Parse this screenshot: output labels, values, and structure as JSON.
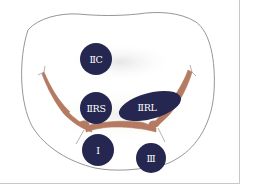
{
  "diagram": {
    "type": "anatomical-zone-diagram",
    "colors": {
      "zone_fill": "#252750",
      "zone_text": "#ffffff",
      "nerve": "#b47a62",
      "outline": "#8a8a8a",
      "shading": "#ececec",
      "frame": "#c8c8c8"
    },
    "zones": [
      {
        "id": "IIC",
        "label": "ⅡC",
        "shape": "circle",
        "cx": 96,
        "cy": 59,
        "r": 16
      },
      {
        "id": "IIRS",
        "label": "ⅡRS",
        "shape": "circle",
        "cx": 96,
        "cy": 108,
        "r": 16
      },
      {
        "id": "IIRL",
        "label": "ⅡRL",
        "shape": "ellipse",
        "cx": 150,
        "cy": 106,
        "rx": 32,
        "ry": 13,
        "rotate": -15
      },
      {
        "id": "I",
        "label": "Ⅰ",
        "shape": "circle",
        "cx": 98,
        "cy": 150,
        "r": 16
      },
      {
        "id": "III",
        "label": "Ⅲ",
        "shape": "circle",
        "cx": 151,
        "cy": 158,
        "r": 15
      }
    ]
  }
}
